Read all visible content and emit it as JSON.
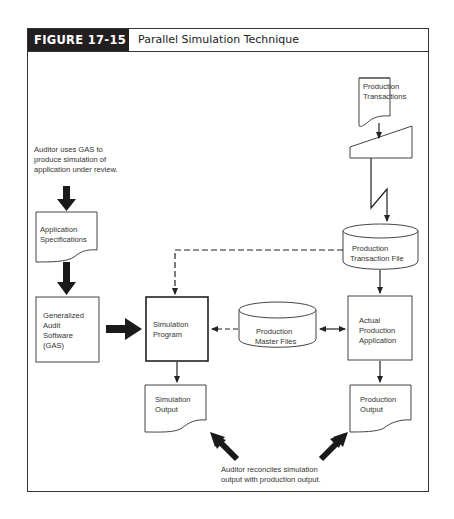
{
  "figure": {
    "label": "FIGURE 17-15",
    "title": "Parallel Simulation Technique"
  },
  "nodes": {
    "production_transactions": {
      "line1": "Production",
      "line2": "Transactions",
      "shape": "document"
    },
    "manual_input": {
      "shape": "manual-input"
    },
    "production_transaction_file": {
      "line1": "Production",
      "line2": "Transaction File",
      "shape": "disk-storage"
    },
    "actual_production_application": {
      "line1": "Actual",
      "line2": "Production",
      "line3": "Application",
      "shape": "process"
    },
    "production_output": {
      "line1": "Production",
      "line2": "Output",
      "shape": "document"
    },
    "production_master_files": {
      "line1": "Production",
      "line2": "Master Files",
      "shape": "disk-storage"
    },
    "simulation_program": {
      "line1": "Simulation",
      "line2": "Program",
      "shape": "process"
    },
    "simulation_output": {
      "line1": "Simulation",
      "line2": "Output",
      "shape": "document"
    },
    "application_specifications": {
      "line1": "Application",
      "line2": "Specifications",
      "shape": "document"
    },
    "gas": {
      "line1": "Generalized",
      "line2": "Audit",
      "line3": "Software",
      "line4": "(GAS)",
      "shape": "process"
    }
  },
  "annotations": {
    "auditor_uses_gas": {
      "line1": "Auditor uses GAS to",
      "line2": "produce simulation of",
      "line3": "application under review."
    },
    "auditor_reconciles": {
      "line1": "Auditor reconciles simulation",
      "line2": "output with production output."
    }
  },
  "edges": [
    {
      "from": "production_transactions",
      "to": "manual_input",
      "style": "solid"
    },
    {
      "from": "manual_input",
      "to": "production_transaction_file",
      "style": "lightning"
    },
    {
      "from": "production_transaction_file",
      "to": "actual_production_application",
      "style": "solid"
    },
    {
      "from": "production_transaction_file",
      "to": "simulation_program",
      "style": "dashed"
    },
    {
      "from": "production_master_files",
      "to": "simulation_program",
      "style": "dashed"
    },
    {
      "from": "production_master_files",
      "to": "actual_production_application",
      "style": "solid-bidirectional"
    },
    {
      "from": "actual_production_application",
      "to": "production_output",
      "style": "solid"
    },
    {
      "from": "simulation_program",
      "to": "simulation_output",
      "style": "solid"
    },
    {
      "from": "application_specifications",
      "to": "gas",
      "style": "bold"
    },
    {
      "from": "gas",
      "to": "simulation_program",
      "style": "bold"
    },
    {
      "from": "auditor_uses_gas",
      "to": "application_specifications",
      "style": "bold"
    },
    {
      "from": "auditor_reconciles",
      "to": "simulation_output",
      "style": "bold"
    },
    {
      "from": "auditor_reconciles",
      "to": "production_output",
      "style": "bold"
    }
  ]
}
